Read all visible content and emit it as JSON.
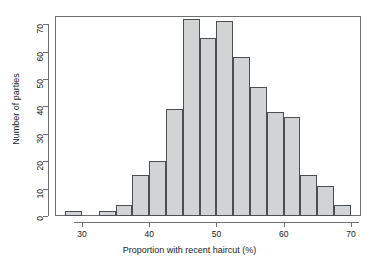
{
  "chart_data": {
    "type": "bar",
    "title": "",
    "subtitle": "",
    "xlabel": "Proportion with recent haircut (%)",
    "ylabel": "Number of parties",
    "xlim": [
      26.0,
      71.5
    ],
    "ylim": [
      0,
      73
    ],
    "grid": false,
    "legend": null,
    "bin_width": 2.5,
    "x_ticks": [
      30,
      40,
      50,
      60,
      70
    ],
    "x_tick_labels": [
      "30",
      "40",
      "50",
      "60",
      "70"
    ],
    "y_ticks": [
      0,
      10,
      20,
      30,
      40,
      50,
      60,
      70
    ],
    "y_tick_labels": [
      "0",
      "10",
      "20",
      "30",
      "40",
      "50",
      "60",
      "70"
    ],
    "bin_edges": [
      27.5,
      30.0,
      32.5,
      35.0,
      37.5,
      40.0,
      42.5,
      45.0,
      47.5,
      50.0,
      52.5,
      55.0,
      57.5,
      60.0,
      62.5,
      65.0,
      67.5,
      70.0
    ],
    "categories": [
      "27.5-30",
      "30-32.5",
      "32.5-35",
      "35-37.5",
      "37.5-40",
      "40-42.5",
      "42.5-45",
      "45-47.5",
      "47.5-50",
      "50-52.5",
      "52.5-55",
      "55-57.5",
      "57.5-60",
      "60-62.5",
      "62.5-65",
      "65-67.5",
      "67.5-70"
    ],
    "values": [
      2,
      0,
      2,
      4,
      15,
      20,
      39,
      72,
      65,
      71,
      58,
      47,
      38,
      36,
      15,
      11,
      4
    ],
    "bar_fill_color": "#d2d3d4",
    "bar_border_color": "#4b4e53",
    "axis_color": "#6d6f74",
    "text_color": "#1c1c1c",
    "background_color": "#ffffff"
  }
}
